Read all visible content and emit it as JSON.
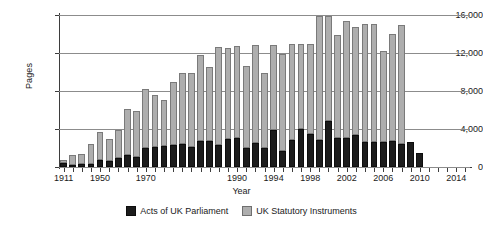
{
  "chart_data": {
    "type": "bar",
    "stacked": true,
    "title": "",
    "xlabel": "Year",
    "ylabel": "Pages",
    "ylim": [
      0,
      16000
    ],
    "yticks": [
      0,
      4000,
      8000,
      12000,
      16000
    ],
    "ytick_labels": [
      "0",
      "4,000",
      "8,000",
      "12,000",
      "16,000"
    ],
    "grid": true,
    "legend_position": "bottom",
    "xtick_labels": [
      "1911",
      "1950",
      "1970",
      "1990",
      "1994",
      "1998",
      "2002",
      "2006",
      "2010",
      "2014"
    ],
    "categories": [
      "1911",
      "1921",
      "1931",
      "1941",
      "1950",
      "1955",
      "1960",
      "1965",
      "1968",
      "1970",
      "1972",
      "1974",
      "1976",
      "1978",
      "1980",
      "1982",
      "1984",
      "1986",
      "1988",
      "1990",
      "1991",
      "1992",
      "1993",
      "1994",
      "1995",
      "1996",
      "1997",
      "1998",
      "1999",
      "2000",
      "2001",
      "2002",
      "2003",
      "2004",
      "2005",
      "2006",
      "2007",
      "2008",
      "2009",
      "2010",
      "2011",
      "2012",
      "2013",
      "2014",
      "2015"
    ],
    "series": [
      {
        "name": "Acts of UK Parliament",
        "color": "#1c1c1c",
        "values": [
          400,
          200,
          300,
          350,
          750,
          600,
          900,
          1300,
          1100,
          2050,
          2100,
          2200,
          2350,
          2400,
          2150,
          2700,
          2700,
          2350,
          2950,
          3100,
          2000,
          2500,
          2050,
          3900,
          1650,
          2800,
          4000,
          3450,
          2800,
          4800,
          3100,
          3100,
          3350,
          2650,
          2600,
          2650,
          2700,
          2400,
          2600,
          1450,
          0,
          0,
          0,
          0,
          0
        ]
      },
      {
        "name": "UK Statutory Instruments",
        "color": "#aeaeae",
        "values": [
          300,
          1100,
          1100,
          2050,
          2950,
          2300,
          3000,
          4800,
          4800,
          6200,
          5450,
          4850,
          6550,
          7500,
          7750,
          9100,
          7800,
          10250,
          9600,
          9600,
          8650,
          10300,
          7900,
          8950,
          10300,
          10100,
          8950,
          9550,
          13100,
          11050,
          10850,
          12250,
          11350,
          12400,
          12450,
          9550,
          11300,
          12600,
          0,
          0,
          0,
          0,
          0,
          0,
          0
        ]
      }
    ]
  },
  "axes": {
    "ylabel": "Pages",
    "xlabel": "Year"
  },
  "legend": {
    "entries": [
      {
        "label": "Acts of UK Parliament",
        "swatch": "acts-swatch"
      },
      {
        "label": "UK Statutory Instruments",
        "swatch": "si-swatch"
      }
    ]
  }
}
